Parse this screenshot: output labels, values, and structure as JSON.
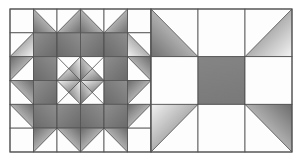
{
  "figure": {
    "width": 302,
    "height": 162,
    "background": "#ffffff"
  },
  "style": {
    "line_color": "#4a4a4a",
    "outer_line_color": "#555555",
    "fill_white": "#fdfdfd",
    "fill_light": "#d9d9d9",
    "fill_mid": "#a8a8a8",
    "fill_dark": "#7c7c7c",
    "fill_solid_gray": "#808080",
    "grid_stroke_width": 0.8,
    "outer_stroke_width": 1.1
  },
  "left_block": {
    "name": "six-by-six triangle block",
    "x": 10,
    "y": 9,
    "width": 141,
    "height": 143,
    "rows": 6,
    "cols": 6,
    "cell_width": 23.5,
    "cell_height": 23.83,
    "pattern_note": "Quarter-square and half-square triangle units arranged into a large on-point diamond with a pinwheel center.",
    "cells": [
      [
        {
          "type": "blank"
        },
        {
          "type": "half",
          "dir": "tl-br",
          "shaded": "lower-left",
          "grad": "light-to-dark"
        },
        {
          "type": "half",
          "dir": "tr-bl",
          "shaded": "lower-right",
          "grad": "light-to-dark"
        },
        {
          "type": "half",
          "dir": "tl-br",
          "shaded": "lower-left",
          "grad": "light-to-dark"
        },
        {
          "type": "half",
          "dir": "tr-bl",
          "shaded": "lower-right",
          "grad": "light-to-dark"
        },
        {
          "type": "blank"
        }
      ],
      [
        {
          "type": "half",
          "dir": "tr-bl",
          "shaded": "lower-right",
          "grad": "dark-to-light"
        },
        {
          "type": "full",
          "tone": "dark"
        },
        {
          "type": "full",
          "tone": "dark"
        },
        {
          "type": "full",
          "tone": "dark"
        },
        {
          "type": "full",
          "tone": "dark"
        },
        {
          "type": "half",
          "dir": "tl-br",
          "shaded": "lower-left",
          "grad": "dark-to-light"
        }
      ],
      [
        {
          "type": "half",
          "dir": "tr-bl",
          "shaded": "upper-left",
          "grad": "dark-to-light"
        },
        {
          "type": "full",
          "tone": "dark"
        },
        {
          "type": "quarter",
          "shaded": "right-bottom",
          "grad": "light-to-dark"
        },
        {
          "type": "quarter",
          "shaded": "left-bottom",
          "grad": "light-to-dark"
        },
        {
          "type": "full",
          "tone": "dark"
        },
        {
          "type": "half",
          "dir": "tl-br",
          "shaded": "upper-right",
          "grad": "dark-to-light"
        }
      ],
      [
        {
          "type": "half",
          "dir": "tl-br",
          "shaded": "upper-right",
          "grad": "dark-to-light"
        },
        {
          "type": "full",
          "tone": "dark"
        },
        {
          "type": "quarter",
          "shaded": "right-top",
          "grad": "light-to-dark"
        },
        {
          "type": "quarter",
          "shaded": "left-top",
          "grad": "light-to-dark"
        },
        {
          "type": "full",
          "tone": "dark"
        },
        {
          "type": "half",
          "dir": "tr-bl",
          "shaded": "upper-left",
          "grad": "dark-to-light"
        }
      ],
      [
        {
          "type": "half",
          "dir": "tl-br",
          "shaded": "upper-right",
          "grad": "dark-to-light"
        },
        {
          "type": "full",
          "tone": "dark"
        },
        {
          "type": "full",
          "tone": "dark"
        },
        {
          "type": "full",
          "tone": "dark"
        },
        {
          "type": "full",
          "tone": "dark"
        },
        {
          "type": "half",
          "dir": "tr-bl",
          "shaded": "upper-left",
          "grad": "dark-to-light"
        }
      ],
      [
        {
          "type": "blank"
        },
        {
          "type": "half",
          "dir": "tr-bl",
          "shaded": "upper-left",
          "grad": "dark-to-light"
        },
        {
          "type": "half",
          "dir": "tl-br",
          "shaded": "upper-right",
          "grad": "dark-to-light"
        },
        {
          "type": "half",
          "dir": "tr-bl",
          "shaded": "upper-left",
          "grad": "dark-to-light"
        },
        {
          "type": "half",
          "dir": "tl-br",
          "shaded": "upper-right",
          "grad": "dark-to-light"
        },
        {
          "type": "blank"
        }
      ]
    ]
  },
  "right_block": {
    "name": "three-by-three nine patch block",
    "x": 151,
    "y": 9,
    "width": 141,
    "height": 143,
    "rows": 3,
    "cols": 3,
    "cell_width": 47,
    "cell_height": 47.67,
    "pattern_note": "Four corner half-square triangle units, four plain side squares and a solid gray center square.",
    "cells": [
      [
        {
          "type": "half",
          "dir": "tl-br",
          "shaded": "lower-left",
          "grad": "light-to-dark"
        },
        {
          "type": "blank"
        },
        {
          "type": "half",
          "dir": "tr-bl",
          "shaded": "lower-left",
          "grad": "dark-to-light"
        }
      ],
      [
        {
          "type": "blank"
        },
        {
          "type": "full",
          "tone": "solid"
        },
        {
          "type": "blank"
        }
      ],
      [
        {
          "type": "half",
          "dir": "tr-bl",
          "shaded": "upper-left",
          "grad": "light-to-dark"
        },
        {
          "type": "blank"
        },
        {
          "type": "half",
          "dir": "tl-br",
          "shaded": "upper-left",
          "grad": "dark-to-light"
        }
      ]
    ]
  }
}
